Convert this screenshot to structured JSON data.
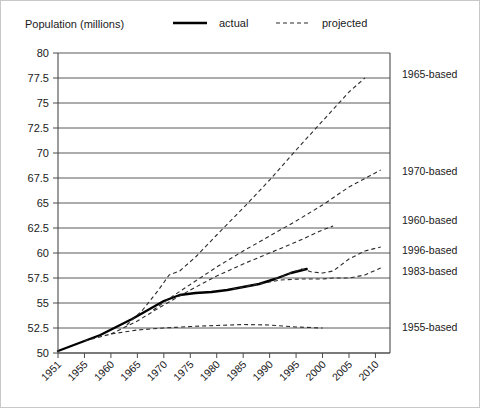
{
  "axis_caption": "Population (millions)",
  "legend": {
    "actual_label": "actual",
    "projected_label": "projected"
  },
  "chart_data": {
    "type": "line",
    "title": "Population (millions)",
    "xlabel": "",
    "ylabel": "Population (millions)",
    "xlim": [
      1951,
      2012
    ],
    "ylim": [
      50,
      80
    ],
    "ytick_step": 2.5,
    "grid": true,
    "legend_position": "top",
    "yticks": [
      50,
      52.5,
      55,
      57.5,
      60,
      62.5,
      65,
      67.5,
      70,
      72.5,
      75,
      77.5,
      80
    ],
    "ytick_labels": [
      "50",
      "52.5",
      "55",
      "57.5",
      "60",
      "62.5",
      "65",
      "67.5",
      "70",
      "72.5",
      "75",
      "77.5",
      "80"
    ],
    "xticks": [
      1951,
      1955,
      1960,
      1965,
      1970,
      1975,
      1980,
      1985,
      1990,
      1995,
      2000,
      2005,
      2010
    ],
    "xtick_labels": [
      "1951",
      "1955",
      "1960",
      "1965",
      "1970",
      "1975",
      "1980",
      "1985",
      "1990",
      "1995",
      "2000",
      "2005",
      "2010"
    ],
    "series": [
      {
        "name": "actual",
        "style": "solid",
        "label": "",
        "x": [
          1951,
          1955,
          1958,
          1961,
          1964,
          1967,
          1970,
          1973,
          1976,
          1979,
          1982,
          1985,
          1988,
          1991,
          1994,
          1997
        ],
        "values": [
          50.2,
          51.2,
          51.8,
          52.6,
          53.4,
          54.3,
          55.2,
          55.8,
          56.0,
          56.1,
          56.3,
          56.6,
          56.9,
          57.4,
          58.0,
          58.4
        ]
      },
      {
        "name": "1955-based",
        "style": "dashed",
        "label": "1955-based",
        "label_y": 52.6,
        "x": [
          1955,
          1960,
          1965,
          1970,
          1975,
          1980,
          1985,
          1990,
          1995,
          2000
        ],
        "values": [
          51.2,
          51.9,
          52.3,
          52.5,
          52.65,
          52.75,
          52.85,
          52.8,
          52.6,
          52.5
        ]
      },
      {
        "name": "1960-based",
        "style": "dashed",
        "label": "1960-based",
        "label_y": 63.3,
        "x": [
          1960,
          1965,
          1970,
          1975,
          1980,
          1985,
          1990,
          1995,
          2000,
          2002
        ],
        "values": [
          51.9,
          53.2,
          54.8,
          56.3,
          57.7,
          58.9,
          60.0,
          61.1,
          62.3,
          62.7
        ]
      },
      {
        "name": "1965-based",
        "style": "dashed",
        "label": "1965-based",
        "label_y": 77.9,
        "x": [
          1963,
          1966,
          1969,
          1971,
          1973,
          1976,
          1980,
          1985,
          1990,
          1995,
          2000,
          2005,
          2008
        ],
        "values": [
          52.8,
          54.3,
          56.3,
          57.8,
          58.2,
          59.6,
          61.8,
          64.5,
          67.3,
          70.3,
          73.2,
          76.1,
          77.5
        ]
      },
      {
        "name": "1970-based",
        "style": "dashed",
        "label": "1970-based",
        "label_y": 68.2,
        "x": [
          1968,
          1972,
          1976,
          1980,
          1985,
          1990,
          1995,
          2000,
          2005,
          2011
        ],
        "values": [
          54.3,
          55.8,
          57.2,
          58.6,
          60.2,
          61.7,
          63.2,
          64.8,
          66.6,
          68.3
        ]
      },
      {
        "name": "1983-based",
        "style": "dashed",
        "label": "1983-based",
        "label_y": 58.2,
        "x": [
          1983,
          1988,
          1992,
          1996,
          2000,
          2002,
          2005,
          2008,
          2011
        ],
        "values": [
          56.4,
          56.9,
          57.3,
          57.4,
          57.4,
          57.5,
          57.5,
          57.8,
          58.5
        ]
      },
      {
        "name": "1996-based",
        "style": "dashed",
        "label": "1996-based",
        "label_y": 60.3,
        "x": [
          1991,
          1994,
          1996,
          1998,
          2000,
          2002,
          2005,
          2008,
          2011
        ],
        "values": [
          57.4,
          58.0,
          58.4,
          58.1,
          58.0,
          58.2,
          59.4,
          60.2,
          60.6
        ]
      }
    ]
  },
  "colors": {
    "actual": "#000000",
    "projected": "#2b2b2b",
    "grid": "#5a5a5a",
    "text": "#1a1a1a",
    "frame": "#c8c8c8"
  }
}
